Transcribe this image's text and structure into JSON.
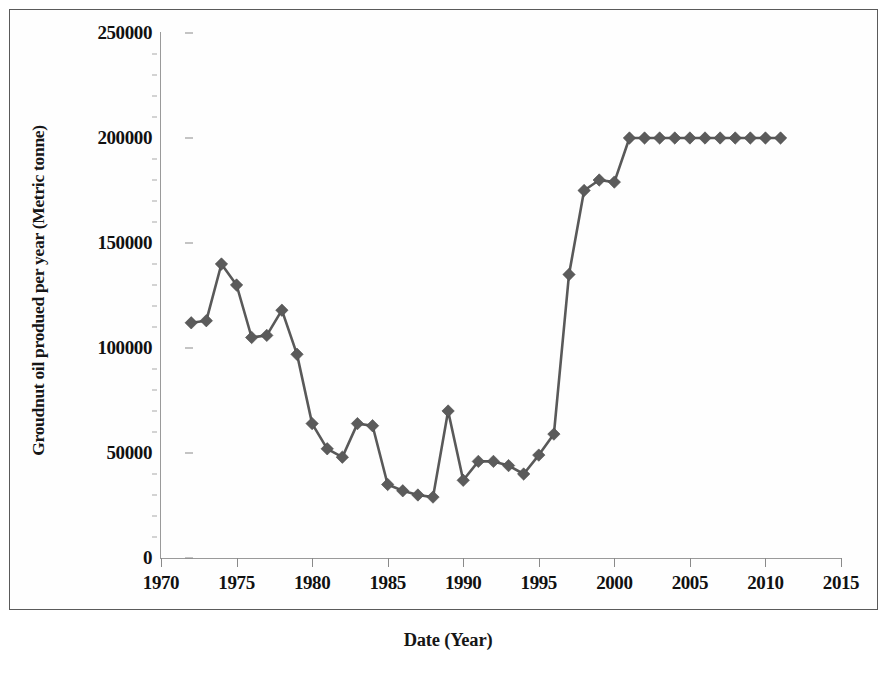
{
  "figure": {
    "frame_border_color": "#5a5a5a",
    "background": "#ffffff",
    "series_color": "#595959"
  },
  "axes": {
    "y_title": "Groudnut oil produed per year (Metric tonne)",
    "x_title": "Date (Year)",
    "y_tick_labels": [
      "250000",
      "200000",
      "150000",
      "100000",
      "50000",
      "0"
    ],
    "x_tick_labels": [
      "1970",
      "1975",
      "1980",
      "1985",
      "1990",
      "1995",
      "2000",
      "2005",
      "2010",
      "2015"
    ]
  },
  "chart_data": {
    "type": "line",
    "title": "",
    "subtitle": "",
    "xlabel": "Date (Year)",
    "ylabel": "Groudnut oil produed per year (Metric tonne)",
    "xlim": [
      1970,
      2015
    ],
    "ylim": [
      0,
      250000
    ],
    "xticks": [
      1970,
      1975,
      1980,
      1985,
      1990,
      1995,
      2000,
      2005,
      2010,
      2015
    ],
    "yticks": [
      0,
      50000,
      100000,
      150000,
      200000,
      250000
    ],
    "grid": false,
    "legend": null,
    "marker": "diamond",
    "series": [
      {
        "name": "Groundnut oil produced per year",
        "x": [
          1972,
          1973,
          1974,
          1975,
          1976,
          1977,
          1978,
          1979,
          1980,
          1981,
          1982,
          1983,
          1984,
          1985,
          1986,
          1987,
          1988,
          1989,
          1990,
          1991,
          1992,
          1993,
          1994,
          1995,
          1996,
          1997,
          1998,
          1999,
          2000,
          2001,
          2002,
          2003,
          2004,
          2005,
          2006,
          2007,
          2008,
          2009,
          2010,
          2011
        ],
        "values": [
          112000,
          113000,
          140000,
          130000,
          105000,
          106000,
          118000,
          97000,
          64000,
          52000,
          48000,
          64000,
          63000,
          35000,
          32000,
          30000,
          29000,
          70000,
          37000,
          46000,
          46000,
          44000,
          40000,
          49000,
          59000,
          135000,
          175000,
          180000,
          179000,
          200000,
          200000,
          200000,
          200000,
          200000,
          200000,
          200000,
          200000,
          200000,
          200000,
          200000
        ]
      }
    ]
  }
}
